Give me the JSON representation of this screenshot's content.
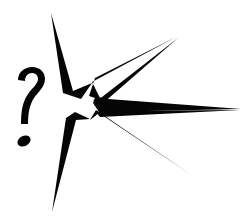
{
  "image": {
    "title": "Starburst with question mark",
    "alt_text": "Black hand-drawn starburst explosion shape with a question mark at its left side",
    "style": "black-and-white line art clipart",
    "background_color": "#ffffff",
    "ink_color": "#050505",
    "canvas": {
      "width": 247,
      "height": 224
    }
  },
  "elements": {
    "starburst": {
      "name": "starburst-shape",
      "description": "Hollow seven-point star / explosion burst with long tapering spikes radiating right, up and down",
      "spike_count": 7,
      "fill": "none",
      "outline_color": "#050505",
      "paths": {
        "top_spike": "M 51 13 L 73 91 L 92 83 L 81 99 L 63 93 Z",
        "upper_right_spike": "M 176 37 L 92 82 L 101 100 L 89 96 L 95 78 Z",
        "upper_mid_right_spike": "M 178 38 L 102 97 L 93 100 L 102 104 Z",
        "far_right_spike": "M 241 109 L 95 98 L 93 103 L 99 112 Z",
        "lower_mid_right_spike": "M 240 110 L 100 117 L 96 112 L 103 111 Z",
        "lower_right_spike": "M 193 176 L 99 113 L 90 120 L 96 110 Z",
        "bottom_spike": "M 52 212 L 76 120 L 90 119 L 75 112 L 66 118 Z",
        "core_outline": "M 73 91 L 63 93 L 81 99 L 76 120 L 66 118 L 75 112 L 90 119 L 99 113 L 96 110 L 103 111 L 100 117 L 96 112 L 93 103 L 99 112 L 95 98 L 102 104 L 93 100 L 102 97 L 89 96 L 101 100 L 92 82 L 92 83 Z"
      }
    },
    "question_mark": {
      "name": "question-mark-glyph",
      "character": "?",
      "description": "Hand-drawn question mark with separate oval dot, positioned left of the starburst",
      "fill": "#050505",
      "hook_path": "M 18 80 C 18 72 25 67 32 67 C 40 67 45 72 45 79 C 45 87 38 92 34 98 C 30 104 28 112 28 124 L 21 124 C 21 110 23 101 28 94 C 32 88 38 84 38 79 C 38 75 35 73 32 73 C 28 73 25 76 25 81 Z",
      "dot": {
        "cx": 24,
        "cy": 141,
        "rx": 7,
        "ry": 5,
        "rotation": -28
      }
    }
  }
}
